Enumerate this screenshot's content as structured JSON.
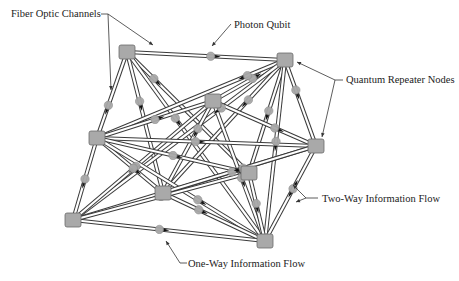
{
  "diagram": {
    "colors": {
      "node_fill": "#a9a9a9",
      "node_stroke": "#6a6a6a",
      "fiber_outer": "#3a3a3a",
      "fiber_inner": "#ffffff",
      "qubit_fill": "#a8a8a8",
      "arrow": "#111111",
      "callout": "#333333"
    },
    "nodes": [
      {
        "id": "n1",
        "x": 127,
        "y": 52
      },
      {
        "id": "n2",
        "x": 285,
        "y": 60
      },
      {
        "id": "n3",
        "x": 213,
        "y": 101
      },
      {
        "id": "n4",
        "x": 97,
        "y": 138
      },
      {
        "id": "n5",
        "x": 316,
        "y": 146
      },
      {
        "id": "n6",
        "x": 163,
        "y": 193
      },
      {
        "id": "n7",
        "x": 249,
        "y": 173
      },
      {
        "id": "n8",
        "x": 73,
        "y": 220
      },
      {
        "id": "n9",
        "x": 265,
        "y": 241
      }
    ],
    "edges": [
      {
        "from": "n1",
        "to": "n2",
        "qubit": 0.53,
        "dir": 1
      },
      {
        "from": "n1",
        "to": "n4",
        "qubit": 0.62,
        "dir": 1
      },
      {
        "from": "n1",
        "to": "n6",
        "qubit": 0.35,
        "dir": 1
      },
      {
        "from": "n1",
        "to": "n7",
        "qubit": 0.22,
        "dir": 1
      },
      {
        "from": "n1",
        "to": "n9",
        "qubit": 0.35,
        "dir": 1
      },
      {
        "from": "n2",
        "to": "n3",
        "qubit": 0.45,
        "dir": -1
      },
      {
        "from": "n2",
        "to": "n4",
        "qubit": 0.2,
        "dir": 1
      },
      {
        "from": "n2",
        "to": "n5",
        "qubit": 0.35,
        "dir": 1
      },
      {
        "from": "n2",
        "to": "n6",
        "qubit": 0.3,
        "dir": 1
      },
      {
        "from": "n2",
        "to": "n7",
        "qubit": 0.45,
        "dir": 1
      },
      {
        "from": "n2",
        "to": "n8",
        "qubit": 0.3,
        "dir": 1
      },
      {
        "from": "n2",
        "to": "n9",
        "qubit": 0.45,
        "dir": 1
      },
      {
        "from": "n3",
        "to": "n4",
        "qubit": 0.5,
        "dir": -1
      },
      {
        "from": "n3",
        "to": "n6",
        "qubit": 0.3,
        "dir": 1
      },
      {
        "from": "n3",
        "to": "n8",
        "qubit": 0.55,
        "dir": 1
      },
      {
        "from": "n3",
        "to": "n5",
        "qubit": 0.6,
        "dir": 1
      },
      {
        "from": "n3",
        "to": "n9",
        "qubit": 0.55,
        "dir": 1
      },
      {
        "from": "n4",
        "to": "n5",
        "qubit": 0.45,
        "dir": 1
      },
      {
        "from": "n4",
        "to": "n6",
        "qubit": 0.55,
        "dir": 1
      },
      {
        "from": "n4",
        "to": "n7",
        "qubit": 0.5,
        "dir": 1
      },
      {
        "from": "n4",
        "to": "n8",
        "qubit": 0.5,
        "dir": 1
      },
      {
        "from": "n4",
        "to": "n9",
        "qubit": 0.6,
        "dir": 1
      },
      {
        "from": "n5",
        "to": "n6",
        "qubit": 0.55,
        "dir": -1
      },
      {
        "from": "n5",
        "to": "n8",
        "qubit": 0.3,
        "dir": 1
      },
      {
        "from": "n5",
        "to": "n9",
        "qubit": 0.45,
        "dir": 0
      },
      {
        "from": "n6",
        "to": "n9",
        "qubit": 0.35,
        "dir": 1
      },
      {
        "from": "n7",
        "to": "n9",
        "qubit": 0.45,
        "dir": 1
      },
      {
        "from": "n8",
        "to": "n9",
        "qubit": 0.45,
        "dir": 1
      },
      {
        "from": "n8",
        "to": "n7",
        "qubit": 0.5,
        "dir": 1
      }
    ],
    "labels": [
      {
        "id": "fiber-optic-channels",
        "text": "Fiber Optic Channels",
        "x": 11,
        "y": 8
      },
      {
        "id": "photon-qubit",
        "text": "Photon Qubit",
        "x": 234,
        "y": 19
      },
      {
        "id": "quantum-repeater-nodes",
        "text": "Quantum Repeater Nodes",
        "x": 346,
        "y": 74
      },
      {
        "id": "two-way-information-flow",
        "text": "Two-Way Information Flow",
        "x": 322,
        "y": 193
      },
      {
        "id": "one-way-information-flow",
        "text": "One-Way Information Flow",
        "x": 188,
        "y": 258
      }
    ],
    "callouts": [
      {
        "points": [
          [
            101,
            14
          ],
          [
            108,
            14
          ],
          [
            153,
            45
          ]
        ]
      },
      {
        "points": [
          [
            108,
            14
          ],
          [
            111,
            90
          ]
        ]
      },
      {
        "points": [
          [
            231,
            24
          ],
          [
            212,
            46
          ]
        ]
      },
      {
        "points": [
          [
            343,
            80
          ],
          [
            335,
            80
          ],
          [
            297,
            62
          ]
        ]
      },
      {
        "points": [
          [
            335,
            80
          ],
          [
            322,
            137
          ]
        ]
      },
      {
        "points": [
          [
            318,
            198
          ],
          [
            306,
            198
          ],
          [
            293,
            185
          ]
        ]
      },
      {
        "points": [
          [
            306,
            198
          ],
          [
            296,
            202
          ]
        ]
      },
      {
        "points": [
          [
            187,
            263
          ],
          [
            180,
            263
          ],
          [
            166,
            241
          ]
        ]
      }
    ]
  }
}
